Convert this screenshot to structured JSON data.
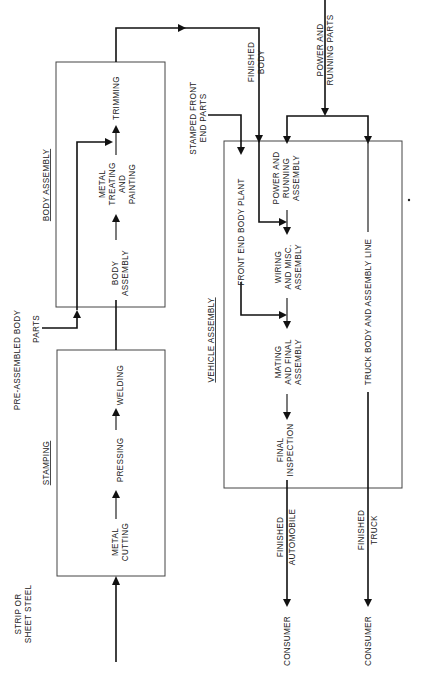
{
  "sections": {
    "stamping": {
      "title": "STAMPING",
      "steps": [
        {
          "lines": [
            "METAL",
            "CUTTING"
          ]
        },
        {
          "lines": [
            "PRESSING"
          ]
        },
        {
          "lines": [
            "WELDING"
          ]
        }
      ]
    },
    "body_assembly": {
      "title": "BODY ASSEMBLY",
      "steps": [
        {
          "lines": [
            "BODY",
            "ASSEMBLY"
          ]
        },
        {
          "lines": [
            "METAL",
            "TREATING",
            "AND",
            "PAINTING"
          ]
        },
        {
          "lines": [
            "TRIMMING"
          ]
        }
      ]
    },
    "vehicle_assembly": {
      "title": "VEHICLE ASSEMBLY",
      "steps": [
        {
          "lines": [
            "POWER AND",
            "RUNNING",
            "ASSEMBLY"
          ]
        },
        {
          "lines": [
            "WIRING",
            "AND MISC.",
            "ASSEMBLY"
          ]
        },
        {
          "lines": [
            "MATING",
            "AND FINAL",
            "ASSEMBLY"
          ]
        },
        {
          "lines": [
            "FINAL",
            "INSPECTION"
          ]
        }
      ],
      "front_end_plant": "FRONT END BODY PLANT",
      "truck_line": "TRUCK BODY AND ASSEMBLY LINE"
    }
  },
  "inputs": {
    "strip_steel": [
      "STRIP OR",
      "SHEET STEEL"
    ],
    "pre_assembled": [
      "PRE-ASSEMBLED  BODY",
      "PARTS"
    ],
    "finished_body": [
      "FINISHED",
      "BODY"
    ],
    "stamped_front": [
      "STAMPED FRONT",
      "END PARTS"
    ],
    "power_parts": [
      "POWER AND",
      "RUNNING PARTS"
    ]
  },
  "outputs": {
    "automobile": {
      "label": [
        "FINISHED",
        "AUTOMOBILE"
      ],
      "dest": "CONSUMER"
    },
    "truck": {
      "label": [
        "FINISHED",
        "TRUCK"
      ],
      "dest": "CONSUMER"
    }
  }
}
